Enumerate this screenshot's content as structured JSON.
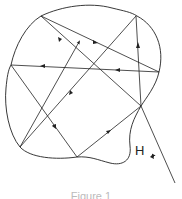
{
  "diagram": {
    "label": "H",
    "caption": "Figure 1",
    "stroke_color": "#222222",
    "boundary": "M41,16 C55,8 85,3 108,10 C122,14 132,12 140,16 C158,24 165,45 159,72 C156,86 146,98 141,106 C133,118 128,128 130,148 C131,160 124,166 112,163 C100,160 90,156 77,157 C55,159 30,158 20,147 C8,132 4,105 6,85 C7,70 9,60 11,65 C14,45 25,26 41,16 Z",
    "segments": [
      {
        "from": [
          175,
          183
        ],
        "to": [
          141,
          106
        ],
        "arrow_at": [
          153,
          155
        ]
      },
      {
        "from": [
          141,
          106
        ],
        "to": [
          136,
          16
        ],
        "arrow_at": [
          138,
          48
        ]
      },
      {
        "from": [
          136,
          16
        ],
        "to": [
          20,
          147
        ],
        "arrow_at": [
          68,
          92
        ]
      },
      {
        "from": [
          20,
          147
        ],
        "to": [
          78,
          43
        ],
        "arrow_at": [
          78,
          43
        ]
      },
      {
        "from": [
          41,
          16
        ],
        "to": [
          159,
          72
        ],
        "arrow_at": [
          96,
          42
        ]
      },
      {
        "from": [
          159,
          72
        ],
        "to": [
          11,
          65
        ],
        "arrow_at": [
          40,
          66
        ]
      },
      {
        "from": [
          11,
          65
        ],
        "to": [
          77,
          157
        ],
        "arrow_at": [
          55,
          127
        ]
      },
      {
        "from": [
          77,
          157
        ],
        "to": [
          141,
          106
        ],
        "arrow_at": [
          110,
          131
        ]
      },
      {
        "from": [
          141,
          106
        ],
        "to": [
          41,
          16
        ],
        "arrow_at": [
          58,
          37
        ]
      }
    ]
  }
}
